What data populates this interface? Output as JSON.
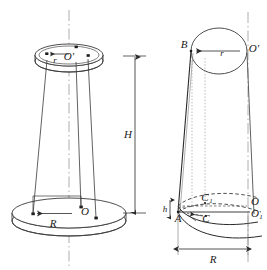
{
  "figure": {
    "stroke_color": "#3a3a3a",
    "dash_color": "#4a4a4a",
    "dot_color": "#8a8a8a",
    "axis_color": "#8a8a8a",
    "background": "#ffffff"
  },
  "left_figure": {
    "name": "trifilar-pendulum",
    "top_disk": {
      "center_label": "O'",
      "radius_label": "r",
      "attachment_points": 3
    },
    "bottom_disk": {
      "center_label": "O",
      "radius_label": "R",
      "attachment_points": 3
    },
    "height_dimension": {
      "label": "H"
    },
    "axis": {
      "name": "vertical-center-axis",
      "style": "dash-dot"
    }
  },
  "right_figure": {
    "name": "cone-geometry",
    "labels": {
      "top_point": "B",
      "top_center": "O'",
      "top_radius": "r",
      "bottom_point": "A",
      "mid_point_upper": "C",
      "mid_point_lower": "C",
      "mid_point_upper_sub": "1",
      "bottom_center": "O",
      "bottom_center_lower": "O",
      "bottom_center_lower_sub": "1",
      "height_small": "h",
      "base_radius": "R"
    },
    "axis": {
      "name": "vertical-center-axis",
      "style": "dash-dot"
    }
  }
}
